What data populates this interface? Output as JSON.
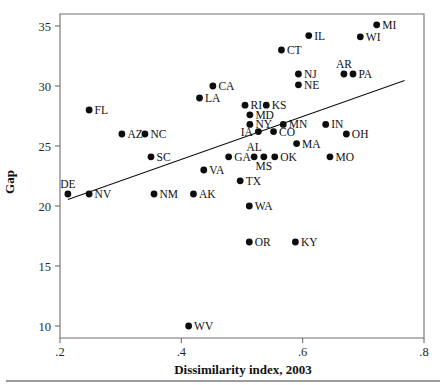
{
  "chart_data": {
    "type": "scatter",
    "title": "",
    "xlabel": "Dissimilarity index, 2003",
    "ylabel": "Gap",
    "xlim": [
      0.2,
      0.8
    ],
    "ylim": [
      9.0,
      36.0
    ],
    "xticks": [
      ".2",
      ".4",
      ".6",
      ".8"
    ],
    "xtick_values": [
      0.2,
      0.4,
      0.6,
      0.8
    ],
    "yticks": [
      "10",
      "15",
      "20",
      "25",
      "30",
      "35"
    ],
    "ytick_values": [
      10,
      15,
      20,
      25,
      30,
      35
    ],
    "grid": false,
    "legend": null,
    "marker": "filled-circle",
    "marker_color": "#0d0d0d",
    "fit_line": {
      "type": "linear-regression",
      "x_start": 0.213,
      "y_start": 20.55,
      "x_end": 0.768,
      "y_end": 30.45,
      "color": "#111111"
    },
    "points": [
      {
        "label": "MI",
        "x": 0.722,
        "y": 35.1,
        "lpos": "right"
      },
      {
        "label": "WI",
        "x": 0.695,
        "y": 34.1,
        "lpos": "right"
      },
      {
        "label": "IL",
        "x": 0.61,
        "y": 34.2,
        "lpos": "right"
      },
      {
        "label": "CT",
        "x": 0.565,
        "y": 33.0,
        "lpos": "right"
      },
      {
        "label": "NJ",
        "x": 0.593,
        "y": 31.0,
        "lpos": "right"
      },
      {
        "label": "NE",
        "x": 0.593,
        "y": 30.1,
        "lpos": "right"
      },
      {
        "label": "AR",
        "x": 0.668,
        "y": 31.0,
        "lpos": "above"
      },
      {
        "label": "PA",
        "x": 0.683,
        "y": 31.0,
        "lpos": "right"
      },
      {
        "label": "CA",
        "x": 0.452,
        "y": 30.0,
        "lpos": "right"
      },
      {
        "label": "LA",
        "x": 0.43,
        "y": 29.0,
        "lpos": "right"
      },
      {
        "label": "FL",
        "x": 0.248,
        "y": 28.0,
        "lpos": "right"
      },
      {
        "label": "RI",
        "x": 0.505,
        "y": 28.4,
        "lpos": "right"
      },
      {
        "label": "KS",
        "x": 0.54,
        "y": 28.4,
        "lpos": "right"
      },
      {
        "label": "MD",
        "x": 0.513,
        "y": 27.6,
        "lpos": "right"
      },
      {
        "label": "NY",
        "x": 0.513,
        "y": 26.8,
        "lpos": "right"
      },
      {
        "label": "MN",
        "x": 0.568,
        "y": 26.8,
        "lpos": "right"
      },
      {
        "label": "AZ",
        "x": 0.302,
        "y": 26.0,
        "lpos": "right"
      },
      {
        "label": "NC",
        "x": 0.34,
        "y": 26.0,
        "lpos": "right"
      },
      {
        "label": "IN",
        "x": 0.638,
        "y": 26.8,
        "lpos": "right"
      },
      {
        "label": "OH",
        "x": 0.672,
        "y": 26.0,
        "lpos": "right"
      },
      {
        "label": "IA",
        "x": 0.527,
        "y": 26.2,
        "lpos": "left"
      },
      {
        "label": "CO",
        "x": 0.552,
        "y": 26.2,
        "lpos": "right"
      },
      {
        "label": "SC",
        "x": 0.35,
        "y": 24.1,
        "lpos": "right"
      },
      {
        "label": "GA",
        "x": 0.478,
        "y": 24.1,
        "lpos": "right"
      },
      {
        "label": "MA",
        "x": 0.59,
        "y": 25.2,
        "lpos": "right"
      },
      {
        "label": "MO",
        "x": 0.645,
        "y": 24.1,
        "lpos": "right"
      },
      {
        "label": "AL",
        "x": 0.52,
        "y": 24.1,
        "lpos": "above"
      },
      {
        "label": "MS",
        "x": 0.536,
        "y": 24.1,
        "lpos": "below"
      },
      {
        "label": "OK",
        "x": 0.554,
        "y": 24.1,
        "lpos": "right"
      },
      {
        "label": "VA",
        "x": 0.437,
        "y": 23.0,
        "lpos": "right"
      },
      {
        "label": "TX",
        "x": 0.497,
        "y": 22.1,
        "lpos": "right"
      },
      {
        "label": "DE",
        "x": 0.213,
        "y": 21.0,
        "lpos": "above"
      },
      {
        "label": "NV",
        "x": 0.248,
        "y": 21.0,
        "lpos": "right"
      },
      {
        "label": "NM",
        "x": 0.355,
        "y": 21.0,
        "lpos": "right"
      },
      {
        "label": "AK",
        "x": 0.42,
        "y": 21.0,
        "lpos": "right"
      },
      {
        "label": "WA",
        "x": 0.512,
        "y": 20.0,
        "lpos": "right"
      },
      {
        "label": "OR",
        "x": 0.512,
        "y": 17.0,
        "lpos": "right"
      },
      {
        "label": "KY",
        "x": 0.588,
        "y": 17.0,
        "lpos": "right"
      },
      {
        "label": "WV",
        "x": 0.412,
        "y": 10.0,
        "lpos": "right"
      }
    ]
  }
}
